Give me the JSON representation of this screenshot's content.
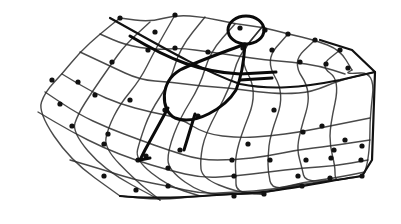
{
  "illustration": {
    "title": "Hand-drawn sketch of a figure lying in a net",
    "background": "#ffffff",
    "ink": "#111111",
    "net": {
      "rows": [
        [
          [
            120,
            18
          ],
          [
            150,
            22
          ],
          [
            175,
            15
          ],
          [
            205,
            17
          ],
          [
            235,
            24
          ],
          [
            262,
            27
          ],
          [
            288,
            34
          ],
          [
            315,
            40
          ],
          [
            340,
            50
          ],
          [
            352,
            70
          ]
        ],
        [
          [
            100,
            34
          ],
          [
            125,
            45
          ],
          [
            155,
            50
          ],
          [
            180,
            48
          ],
          [
            210,
            52
          ],
          [
            238,
            56
          ],
          [
            265,
            60
          ],
          [
            292,
            62
          ],
          [
            320,
            66
          ],
          [
            345,
            74
          ]
        ],
        [
          [
            80,
            52
          ],
          [
            110,
            66
          ],
          [
            140,
            80
          ],
          [
            170,
            82
          ],
          [
            200,
            86
          ],
          [
            230,
            88
          ],
          [
            258,
            92
          ],
          [
            285,
            94
          ],
          [
            312,
            92
          ],
          [
            340,
            80
          ],
          [
            375,
            72
          ]
        ],
        [
          [
            62,
            74
          ],
          [
            92,
            92
          ],
          [
            120,
            104
          ],
          [
            150,
            112
          ],
          [
            180,
            118
          ],
          [
            205,
            134
          ],
          [
            240,
            138
          ],
          [
            270,
            136
          ],
          [
            300,
            132
          ],
          [
            330,
            126
          ],
          [
            370,
            118
          ]
        ],
        [
          [
            45,
            92
          ],
          [
            78,
            114
          ],
          [
            108,
            128
          ],
          [
            140,
            140
          ],
          [
            168,
            150
          ],
          [
            200,
            160
          ],
          [
            235,
            160
          ],
          [
            268,
            156
          ],
          [
            297,
            150
          ],
          [
            330,
            146
          ],
          [
            370,
            140
          ]
        ],
        [
          [
            38,
            112
          ],
          [
            72,
            132
          ],
          [
            104,
            148
          ],
          [
            135,
            160
          ],
          [
            168,
            170
          ],
          [
            202,
            178
          ],
          [
            236,
            176
          ],
          [
            268,
            172
          ],
          [
            302,
            168
          ],
          [
            335,
            166
          ],
          [
            368,
            160
          ]
        ],
        [
          [
            70,
            160
          ],
          [
            104,
            170
          ],
          [
            135,
            180
          ],
          [
            168,
            186
          ],
          [
            202,
            194
          ],
          [
            236,
            192
          ],
          [
            272,
            190
          ],
          [
            305,
            182
          ],
          [
            335,
            178
          ],
          [
            365,
            172
          ]
        ],
        [
          [
            120,
            196
          ],
          [
            160,
            200
          ],
          [
            200,
            196
          ],
          [
            232,
            194
          ],
          [
            262,
            194
          ],
          [
            300,
            184
          ],
          [
            338,
            180
          ],
          [
            362,
            176
          ]
        ]
      ],
      "knots": [
        [
          120,
          18
        ],
        [
          155,
          32
        ],
        [
          175,
          15
        ],
        [
          240,
          28
        ],
        [
          265,
          30
        ],
        [
          288,
          34
        ],
        [
          315,
          40
        ],
        [
          340,
          50
        ],
        [
          78,
          82
        ],
        [
          112,
          62
        ],
        [
          148,
          50
        ],
        [
          175,
          48
        ],
        [
          208,
          52
        ],
        [
          243,
          48
        ],
        [
          272,
          50
        ],
        [
          300,
          62
        ],
        [
          326,
          64
        ],
        [
          348,
          68
        ],
        [
          52,
          80
        ],
        [
          95,
          95
        ],
        [
          130,
          100
        ],
        [
          165,
          110
        ],
        [
          198,
          116
        ],
        [
          248,
          144
        ],
        [
          274,
          110
        ],
        [
          303,
          132
        ],
        [
          322,
          126
        ],
        [
          345,
          140
        ],
        [
          60,
          104
        ],
        [
          108,
          134
        ],
        [
          146,
          156
        ],
        [
          180,
          150
        ],
        [
          232,
          160
        ],
        [
          270,
          160
        ],
        [
          306,
          160
        ],
        [
          334,
          150
        ],
        [
          362,
          146
        ],
        [
          72,
          126
        ],
        [
          104,
          144
        ],
        [
          138,
          160
        ],
        [
          168,
          168
        ],
        [
          234,
          176
        ],
        [
          298,
          176
        ],
        [
          331,
          158
        ],
        [
          361,
          160
        ],
        [
          104,
          176
        ],
        [
          136,
          190
        ],
        [
          168,
          186
        ],
        [
          234,
          196
        ],
        [
          264,
          194
        ],
        [
          302,
          186
        ],
        [
          330,
          178
        ],
        [
          362,
          176
        ]
      ]
    },
    "figure": {
      "head": {
        "cx": 246,
        "cy": 30,
        "rx": 18,
        "ry": 14
      },
      "body_loop": "M 245 44 C 230 50, 200 60, 180 70 C 160 82, 160 110, 175 118 C 195 126, 225 108, 236 90 C 242 76, 244 60, 245 44",
      "arm_upper": "M 130 36 C 170 60, 200 72, 240 74 L 276 72",
      "arm_lower": "M 240 80 L 272 78",
      "leg_left": "M 168 108 L 145 150 L 140 160",
      "leg_right": "M 195 114 L 184 150",
      "foot": "M 140 160 L 150 158"
    }
  }
}
